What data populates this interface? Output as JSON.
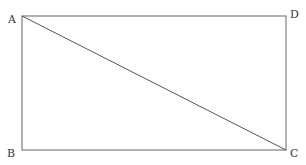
{
  "diagram": {
    "stroke_color": "#555555",
    "vertices": [
      {
        "label": "A",
        "x": 22,
        "y": 16
      },
      {
        "label": "B",
        "x": 22,
        "y": 150
      },
      {
        "label": "C",
        "x": 286,
        "y": 150
      },
      {
        "label": "D",
        "x": 286,
        "y": 16
      }
    ],
    "edges": [
      [
        "A",
        "B"
      ],
      [
        "B",
        "C"
      ],
      [
        "C",
        "D"
      ],
      [
        "D",
        "A"
      ],
      [
        "A",
        "C"
      ]
    ],
    "labels": {
      "a": "A",
      "b": "B",
      "c": "C",
      "d": "D"
    }
  }
}
